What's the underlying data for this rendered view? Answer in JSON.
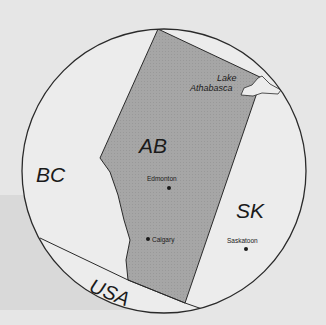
{
  "map": {
    "regions": {
      "ab": {
        "label": "AB",
        "fill": "#a8a8a8"
      },
      "bc": {
        "label": "BC",
        "fill": "#ececec"
      },
      "sk": {
        "label": "SK",
        "fill": "#ececec"
      },
      "usa": {
        "label": "USA",
        "fill": "#ececec"
      }
    },
    "lake": {
      "label_line1": "Lake",
      "label_line2": "Athabasca"
    },
    "cities": [
      {
        "name": "Edmonton"
      },
      {
        "name": "Calgary"
      },
      {
        "name": "Saskatoon"
      }
    ],
    "colors": {
      "background": "#e6e6e6",
      "band": "#d9d9d9",
      "outline": "#2a2a2a",
      "land": "#ececec",
      "alberta": "#a8a8a8"
    }
  }
}
